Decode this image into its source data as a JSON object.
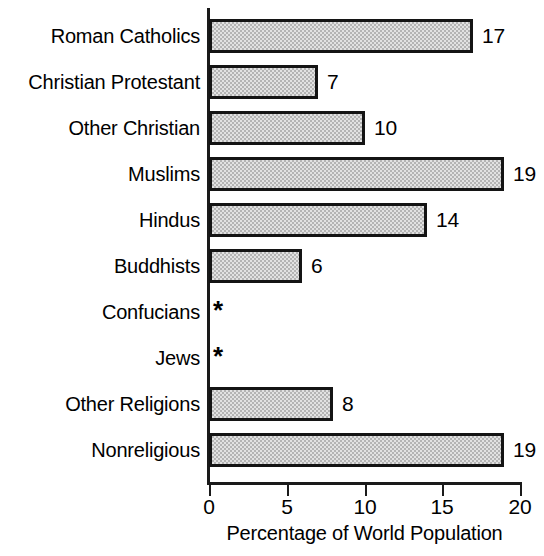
{
  "chart_data": {
    "type": "bar",
    "orientation": "horizontal",
    "title": "",
    "xlabel": "Percentage of World Population",
    "ylabel": "",
    "xlim": [
      0,
      20
    ],
    "xticks": [
      0,
      5,
      10,
      15,
      20
    ],
    "xtick_labels": [
      "0",
      "5",
      "10",
      "15",
      "20"
    ],
    "grid": false,
    "legend": false,
    "footnote_symbol": "*",
    "categories": [
      "Roman Catholics",
      "Christian Protestant",
      "Other Christian",
      "Muslims",
      "Hindus",
      "Buddhists",
      "Confucians",
      "Jews",
      "Other Religions",
      "Nonreligious"
    ],
    "values": [
      17,
      7,
      10,
      19,
      14,
      6,
      null,
      null,
      8,
      19
    ],
    "value_labels": [
      "17",
      "7",
      "10",
      "19",
      "14",
      "6",
      "*",
      "*",
      "8",
      "19"
    ],
    "bars": [
      {
        "category": "Roman Catholics",
        "value": 17,
        "label": "17",
        "has_bar": true
      },
      {
        "category": "Christian Protestant",
        "value": 7,
        "label": "7",
        "has_bar": true
      },
      {
        "category": "Other Christian",
        "value": 10,
        "label": "10",
        "has_bar": true
      },
      {
        "category": "Muslims",
        "value": 19,
        "label": "19",
        "has_bar": true
      },
      {
        "category": "Hindus",
        "value": 14,
        "label": "14",
        "has_bar": true
      },
      {
        "category": "Buddhists",
        "value": 6,
        "label": "6",
        "has_bar": true
      },
      {
        "category": "Confucians",
        "value": null,
        "label": "*",
        "has_bar": false
      },
      {
        "category": "Jews",
        "value": null,
        "label": "*",
        "has_bar": false
      },
      {
        "category": "Other Religions",
        "value": 8,
        "label": "8",
        "has_bar": true
      },
      {
        "category": "Nonreligious",
        "value": 19,
        "label": "19",
        "has_bar": true
      }
    ],
    "colors": {
      "bar_fill": "#b4b4b4",
      "bar_border": "#141414",
      "axis": "#1a1a1a",
      "text": "#000000",
      "background": "#ffffff"
    }
  }
}
